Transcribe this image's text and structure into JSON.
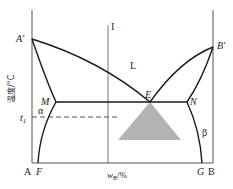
{
  "diagram": {
    "type": "binary eutectic phase diagram",
    "y_axis_label": "温度/°C",
    "x_axis_label_main": "w",
    "x_axis_label_sub": "B",
    "x_axis_label_unit": "/%",
    "component_left": "A",
    "component_right": "B",
    "points": {
      "A_prime": "A'",
      "B_prime": "B'",
      "E": "E",
      "M": "M",
      "N": "N",
      "F": "F",
      "G": "G"
    },
    "regions": {
      "liquid": "L",
      "alpha": "α",
      "beta": "β"
    },
    "composition_line": "I",
    "temperature_marker": "t",
    "temperature_marker_sub": "1",
    "colors": {
      "lines": "#1a1a1a",
      "axes": "#555555",
      "triangle_fill": "#b3b3b3"
    }
  }
}
